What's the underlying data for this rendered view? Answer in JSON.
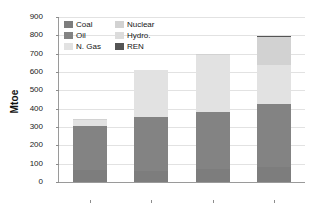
{
  "chart_data": {
    "type": "bar",
    "subtype": "stacked-bar",
    "title": "",
    "xlabel": "",
    "ylabel": "Mtoe",
    "ylim": [
      0,
      900
    ],
    "ytick_step": 100,
    "yticks": [
      900,
      800,
      700,
      600,
      500,
      400,
      300,
      200,
      100,
      0
    ],
    "grid": true,
    "legend_position": "top-left-inside",
    "categories": [
      "1971",
      "2000",
      "2010",
      "2025"
    ],
    "series": [
      {
        "name": "Coal",
        "color": "#7d7d7d",
        "values": [
          65,
          60,
          70,
          80
        ]
      },
      {
        "name": "Oil",
        "color": "#838383",
        "values": [
          240,
          295,
          310,
          345
        ]
      },
      {
        "name": "N. Gas",
        "color": "#e2e2e2",
        "values": [
          35,
          255,
          315,
          215
        ]
      },
      {
        "name": "Nuclear",
        "color": "#d2d2d2",
        "values": [
          3,
          2,
          3,
          150
        ]
      },
      {
        "name": "Hydro.",
        "color": "#dcdcdc",
        "values": [
          2,
          0,
          1,
          0
        ]
      },
      {
        "name": "REN",
        "color": "#545454",
        "values": [
          0,
          0,
          1,
          8
        ]
      }
    ],
    "totals": [
      345,
      612,
      700,
      798
    ]
  },
  "axis": {
    "y_title": "Mtoe"
  },
  "legend": {
    "entries": [
      {
        "label": "Coal",
        "color": "#7d7d7d"
      },
      {
        "label": "Nuclear",
        "color": "#d2d2d2"
      },
      {
        "label": "Oil",
        "color": "#838383"
      },
      {
        "label": "Hydro.",
        "color": "#dcdcdc"
      },
      {
        "label": "N. Gas",
        "color": "#e2e2e2"
      },
      {
        "label": "REN",
        "color": "#545454"
      }
    ]
  },
  "colors": {
    "axis_line": "#9a9a9a",
    "gridline": "#e2e2e2",
    "background": "#ffffff",
    "text": "#1a1a1a"
  }
}
